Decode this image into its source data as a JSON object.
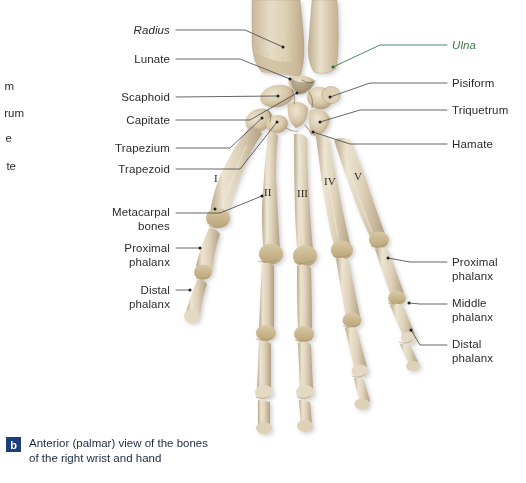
{
  "figure": {
    "title": "Anterior (palmar) view of the bones of the right wrist and hand",
    "caption_badge": "b",
    "caption_text": "Anterior (palmar) view of the bones\nof the right wrist and hand",
    "background_color": "#ffffff",
    "badge_color": "#1c3f77",
    "caption_text_color": "#1b2a44",
    "leader_line_color": "#555555",
    "label_color": "#2b2b2b",
    "accent_green": "#3d7a4e"
  },
  "labels_left": [
    {
      "id": "radius",
      "text": "Radius",
      "style": "italic",
      "color": "#2b2b2b",
      "x": 170,
      "y": 24,
      "anchor_x": 283,
      "anchor_y": 47
    },
    {
      "id": "lunate",
      "text": "Lunate",
      "style": "normal",
      "color": "#2b2b2b",
      "x": 170,
      "y": 53,
      "anchor_x": 290,
      "anchor_y": 79
    },
    {
      "id": "scaphoid",
      "text": "Scaphoid",
      "style": "normal",
      "color": "#2b2b2b",
      "x": 170,
      "y": 91,
      "anchor_x": 278,
      "anchor_y": 96
    },
    {
      "id": "capitate",
      "text": "Capitate",
      "style": "normal",
      "color": "#2b2b2b",
      "x": 170,
      "y": 114,
      "anchor_x": 297,
      "anchor_y": 93
    },
    {
      "id": "trapezium",
      "text": "Trapezium",
      "style": "normal",
      "color": "#2b2b2b",
      "x": 170,
      "y": 142,
      "anchor_x": 262,
      "anchor_y": 118
    },
    {
      "id": "trapezoid",
      "text": "Trapezoid",
      "style": "normal",
      "color": "#2b2b2b",
      "x": 170,
      "y": 163,
      "anchor_x": 277,
      "anchor_y": 122
    },
    {
      "id": "metacarpal-bones",
      "text": "Metacarpal\nbones",
      "style": "normal",
      "color": "#2b2b2b",
      "x": 170,
      "y": 206,
      "anchor_x": 262,
      "anchor_y": 213
    },
    {
      "id": "proximal-phalanx-left",
      "text": "Proximal\nphalanx",
      "style": "normal",
      "color": "#2b2b2b",
      "x": 170,
      "y": 242,
      "anchor_x": 200,
      "anchor_y": 248
    },
    {
      "id": "distal-phalanx-left",
      "text": "Distal\nphalanx",
      "style": "normal",
      "color": "#2b2b2b",
      "x": 170,
      "y": 284,
      "anchor_x": 190,
      "anchor_y": 290
    }
  ],
  "labels_right": [
    {
      "id": "ulna",
      "text": "Ulna",
      "style": "italic",
      "color": "#3d7a4e",
      "x": 452,
      "y": 39,
      "anchor_x": 333,
      "anchor_y": 67
    },
    {
      "id": "pisiform",
      "text": "Pisiform",
      "style": "normal",
      "color": "#2b2b2b",
      "x": 452,
      "y": 77,
      "anchor_x": 330,
      "anchor_y": 97
    },
    {
      "id": "triquetrum",
      "text": "Triquetrum",
      "style": "normal",
      "color": "#2b2b2b",
      "x": 452,
      "y": 104,
      "anchor_x": 320,
      "anchor_y": 122
    },
    {
      "id": "hamate",
      "text": "Hamate",
      "style": "normal",
      "color": "#2b2b2b",
      "x": 452,
      "y": 138,
      "anchor_x": 313,
      "anchor_y": 132
    },
    {
      "id": "proximal-phalanx-right",
      "text": "Proximal\nphalanx",
      "style": "normal",
      "color": "#2b2b2b",
      "x": 452,
      "y": 256,
      "anchor_x": 388,
      "anchor_y": 258
    },
    {
      "id": "middle-phalanx-right",
      "text": "Middle\nphalanx",
      "style": "normal",
      "color": "#2b2b2b",
      "x": 452,
      "y": 297,
      "anchor_x": 409,
      "anchor_y": 303
    },
    {
      "id": "distal-phalanx-right",
      "text": "Distal\nphalanx",
      "style": "normal",
      "color": "#2b2b2b",
      "x": 452,
      "y": 338,
      "anchor_x": 411,
      "anchor_y": 330
    }
  ],
  "edge_fragments": [
    {
      "id": "frag-1",
      "text": "m",
      "x": 0,
      "y": 86
    },
    {
      "id": "frag-2",
      "text": "rum",
      "x": 0,
      "y": 113
    },
    {
      "id": "frag-3",
      "text": "e",
      "x": 0,
      "y": 138
    },
    {
      "id": "frag-4",
      "text": "te",
      "x": 0,
      "y": 166
    }
  ],
  "roman_numerals": [
    {
      "id": "numeral-I",
      "text": "I",
      "x": 214,
      "y": 172
    },
    {
      "id": "numeral-II",
      "text": "II",
      "x": 264,
      "y": 186
    },
    {
      "id": "numeral-III",
      "text": "III",
      "x": 297,
      "y": 187
    },
    {
      "id": "numeral-IV",
      "text": "IV",
      "x": 324,
      "y": 175
    },
    {
      "id": "numeral-V",
      "text": "V",
      "x": 354,
      "y": 170
    }
  ]
}
